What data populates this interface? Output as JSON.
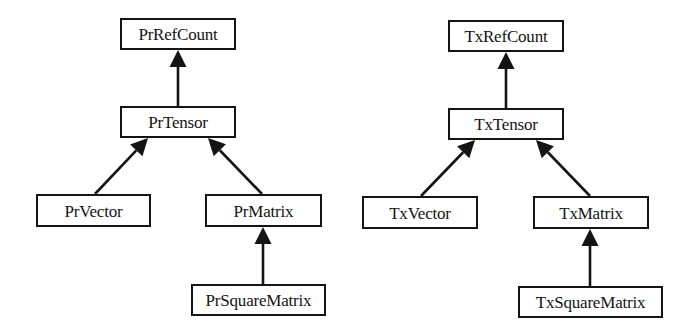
{
  "diagram": {
    "type": "class-inheritance-hierarchy",
    "colors": {
      "stroke": "#141414",
      "background": "#ffffff",
      "text": "#141414"
    },
    "hierarchies": [
      {
        "id": "pr",
        "nodes": [
          {
            "id": "PrRefCount",
            "label": "PrRefCount",
            "x": 120,
            "y": 18,
            "w": 116,
            "h": 32
          },
          {
            "id": "PrTensor",
            "label": "PrTensor",
            "x": 120,
            "y": 106,
            "w": 116,
            "h": 32
          },
          {
            "id": "PrVector",
            "label": "PrVector",
            "x": 36,
            "y": 194,
            "w": 115,
            "h": 33
          },
          {
            "id": "PrMatrix",
            "label": "PrMatrix",
            "x": 205,
            "y": 194,
            "w": 117,
            "h": 33
          },
          {
            "id": "PrSquareMatrix",
            "label": "PrSquareMatrix",
            "x": 191,
            "y": 284,
            "w": 135,
            "h": 32
          }
        ],
        "edges": [
          {
            "from": "PrTensor",
            "to": "PrRefCount",
            "x1": 178,
            "y1": 106,
            "x2": 178,
            "y2": 50
          },
          {
            "from": "PrVector",
            "to": "PrTensor",
            "x1": 95,
            "y1": 194,
            "x2": 148,
            "y2": 138
          },
          {
            "from": "PrMatrix",
            "to": "PrTensor",
            "x1": 262,
            "y1": 194,
            "x2": 208,
            "y2": 138
          },
          {
            "from": "PrSquareMatrix",
            "to": "PrMatrix",
            "x1": 263,
            "y1": 284,
            "x2": 263,
            "y2": 227
          }
        ]
      },
      {
        "id": "tx",
        "nodes": [
          {
            "id": "TxRefCount",
            "label": "TxRefCount",
            "x": 448,
            "y": 20,
            "w": 116,
            "h": 32
          },
          {
            "id": "TxTensor",
            "label": "TxTensor",
            "x": 448,
            "y": 108,
            "w": 116,
            "h": 32
          },
          {
            "id": "TxVector",
            "label": "TxVector",
            "x": 362,
            "y": 196,
            "w": 116,
            "h": 33
          },
          {
            "id": "TxMatrix",
            "label": "TxMatrix",
            "x": 533,
            "y": 196,
            "w": 116,
            "h": 33
          },
          {
            "id": "TxSquareMatrix",
            "label": "TxSquareMatrix",
            "x": 518,
            "y": 286,
            "w": 145,
            "h": 32
          }
        ],
        "edges": [
          {
            "from": "TxTensor",
            "to": "TxRefCount",
            "x1": 506,
            "y1": 108,
            "x2": 506,
            "y2": 52
          },
          {
            "from": "TxVector",
            "to": "TxTensor",
            "x1": 421,
            "y1": 196,
            "x2": 475,
            "y2": 140
          },
          {
            "from": "TxMatrix",
            "to": "TxTensor",
            "x1": 590,
            "y1": 196,
            "x2": 536,
            "y2": 140
          },
          {
            "from": "TxSquareMatrix",
            "to": "TxMatrix",
            "x1": 590,
            "y1": 286,
            "x2": 590,
            "y2": 229
          }
        ]
      }
    ]
  }
}
